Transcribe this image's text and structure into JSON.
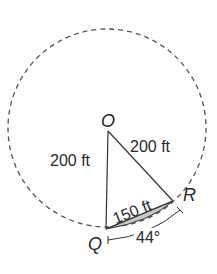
{
  "diagram": {
    "points": {
      "center": "O",
      "q": "Q",
      "r": "R"
    },
    "labels": {
      "oq_length": "200 ft",
      "or_length": "200 ft",
      "qr_chord": "150 ft",
      "arc_angle": "44°"
    },
    "colors": {
      "stroke": "#333333",
      "circle_dash": "#555555",
      "segment_fill": "#c8c8c8"
    }
  }
}
